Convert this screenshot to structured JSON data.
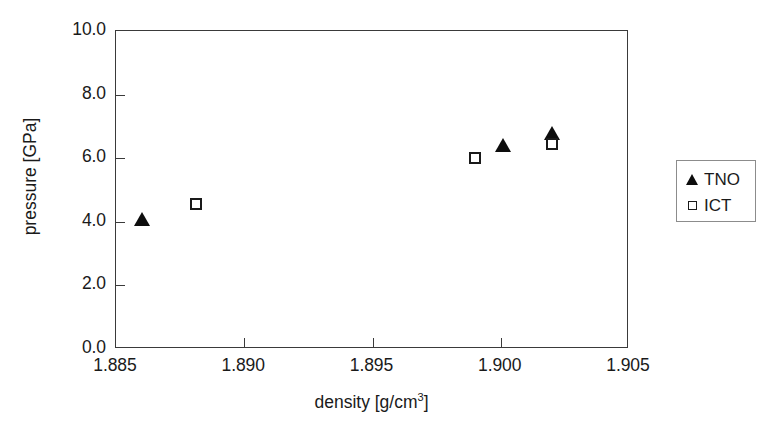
{
  "chart_data": {
    "type": "scatter",
    "title": "",
    "xlabel": "density [g/cm³]",
    "xlabel_base": "density [g/cm",
    "xlabel_sup": "3",
    "xlabel_tail": "]",
    "ylabel": "pressure [GPa]",
    "xlim": [
      1.885,
      1.905
    ],
    "ylim": [
      0.0,
      10.0
    ],
    "xticks": [
      1.885,
      1.89,
      1.895,
      1.9,
      1.905
    ],
    "xticklabels": [
      "1.885",
      "1.890",
      "1.895",
      "1.900",
      "1.905"
    ],
    "yticks": [
      0.0,
      2.0,
      4.0,
      6.0,
      8.0,
      10.0
    ],
    "yticklabels": [
      "0.0",
      "2.0",
      "4.0",
      "6.0",
      "8.0",
      "10.0"
    ],
    "grid": false,
    "legend_position": "right-outside",
    "series": [
      {
        "name": "TNO",
        "marker": "filled-triangle",
        "color": "#0d0d0d",
        "points": [
          {
            "x": 1.886,
            "y": 4.1
          },
          {
            "x": 1.9001,
            "y": 6.4
          },
          {
            "x": 1.902,
            "y": 6.8
          }
        ]
      },
      {
        "name": "ICT",
        "marker": "open-square",
        "color": "#1a1a1a",
        "points": [
          {
            "x": 1.8881,
            "y": 4.55
          },
          {
            "x": 1.899,
            "y": 6.0
          },
          {
            "x": 1.902,
            "y": 6.45
          }
        ]
      }
    ]
  },
  "legend": {
    "entries": [
      {
        "label": "TNO",
        "marker": "filled-triangle"
      },
      {
        "label": "ICT",
        "marker": "open-square"
      }
    ]
  },
  "colors": {
    "frame": "#3a3a3a",
    "marker_fill": "#0d0d0d",
    "background": "#ffffff",
    "legend_border": "#8c8c8c"
  }
}
